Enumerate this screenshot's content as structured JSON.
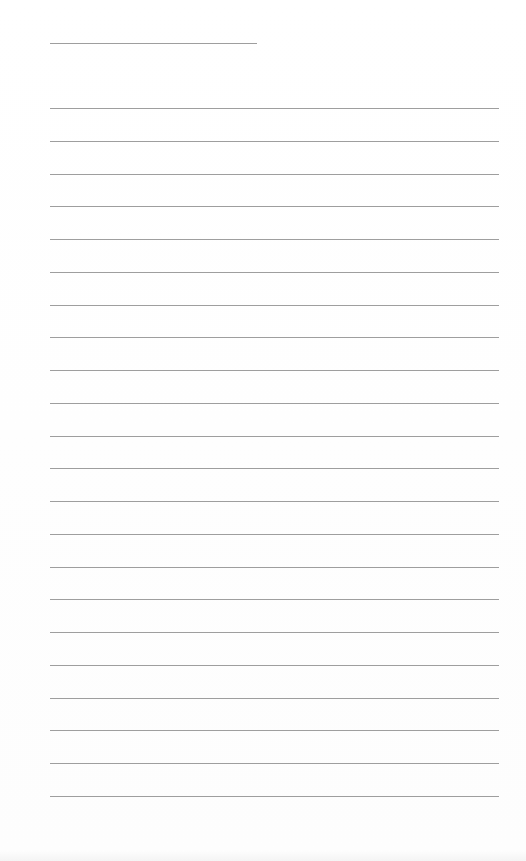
{
  "document": {
    "type": "lined-paper",
    "header_line": {
      "x": 50,
      "y": 43,
      "width": 207
    },
    "ruled_lines": {
      "count": 22,
      "x": 50,
      "width": 449,
      "first_y": 108,
      "spacing": 32.76,
      "color": "#9e9e9e"
    },
    "background_color": "#ffffff"
  }
}
